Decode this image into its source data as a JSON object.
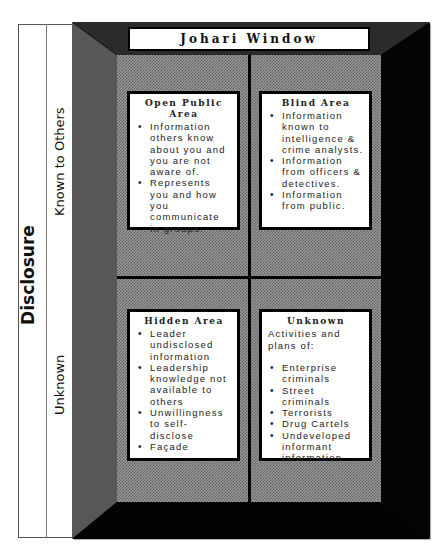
{
  "diagram": {
    "title": "Johari Window",
    "axis_label": "Disclosure",
    "row_labels": [
      "Known to Others",
      "Unknown"
    ],
    "colors": {
      "frame": "#050505",
      "bevel_top": "#2a2a2a",
      "bevel_left": "#555555",
      "panel_pattern": "#9a9a9a",
      "box_background": "#ffffff"
    },
    "quadrants": [
      {
        "title": "Open Public Area",
        "intro": "",
        "items": [
          "Information others know about you and you are not aware of.",
          "Represents you and how you communicate in groups."
        ]
      },
      {
        "title": "Blind Area",
        "intro": "",
        "items": [
          "Information known to intelligence & crime analysts.",
          "Information from officers & detectives.",
          "Information from public."
        ]
      },
      {
        "title": "Hidden Area",
        "intro": "",
        "items": [
          "Leader undisclosed information",
          "Leadership knowledge not available to others",
          "Unwillingness to self-disclose",
          "Façade"
        ]
      },
      {
        "title": "Unknown",
        "intro": "Activities and plans of:",
        "items": [
          "Enterprise criminals",
          "Street criminals",
          "Terrorists",
          "Drug Cartels",
          "Undeveloped informant information"
        ]
      }
    ]
  }
}
